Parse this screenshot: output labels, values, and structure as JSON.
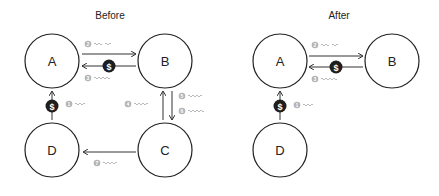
{
  "panels": [
    {
      "title": "Before",
      "nodes": [
        {
          "id": "A",
          "label": "A"
        },
        {
          "id": "B",
          "label": "B"
        },
        {
          "id": "C",
          "label": "C"
        },
        {
          "id": "D",
          "label": "D"
        }
      ],
      "steps": [
        {
          "num": "1",
          "from": "D",
          "to": "A",
          "payment": true
        },
        {
          "num": "2",
          "from": "A",
          "to": "B",
          "payment": false
        },
        {
          "num": "3",
          "from": "B",
          "to": "A",
          "payment": true
        },
        {
          "num": "4",
          "from": "C",
          "to": "B",
          "payment": false
        },
        {
          "num": "5",
          "from": "B",
          "to": "C",
          "payment": false
        },
        {
          "num": "6",
          "from": "B",
          "to": "C",
          "payment": false
        },
        {
          "num": "7",
          "from": "C",
          "to": "D",
          "payment": false
        }
      ]
    },
    {
      "title": "After",
      "nodes": [
        {
          "id": "A",
          "label": "A"
        },
        {
          "id": "B",
          "label": "B"
        },
        {
          "id": "D",
          "label": "D"
        }
      ],
      "steps": [
        {
          "num": "1",
          "from": "D",
          "to": "A",
          "payment": true
        },
        {
          "num": "2",
          "from": "A",
          "to": "B",
          "payment": false
        },
        {
          "num": "3",
          "from": "B",
          "to": "A",
          "payment": true
        }
      ]
    }
  ],
  "icons": {
    "payment_symbol": "$"
  },
  "colors": {
    "stroke": "#222222",
    "badge": "#b4b4b4",
    "coin": "#1e1e1e"
  }
}
